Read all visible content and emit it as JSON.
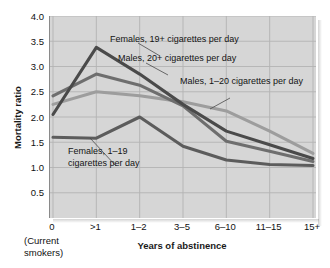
{
  "chart_data": {
    "type": "line",
    "title": "",
    "xlabel": "Years of abstinence",
    "ylabel": "Mortality ratio",
    "xaxis_note": "(Current\nsmokers)",
    "xaxis_note_line1": "(Current",
    "xaxis_note_line2": "smokers)",
    "categories": [
      "0",
      ">1",
      "1–2",
      "3–5",
      "6–10",
      "11–15",
      "15+"
    ],
    "ylim": [
      0.0,
      4.0
    ],
    "yticks": [
      "4.0",
      "3.5",
      "3.0",
      "2.5",
      "2.0",
      "1.5",
      "1.0",
      "0.5"
    ],
    "ytick_values": [
      4.0,
      3.5,
      3.0,
      2.5,
      2.0,
      1.5,
      1.0,
      0.5
    ],
    "grid": true,
    "legend_position": "inline-annotations",
    "series": [
      {
        "name": "Females, 19+ cigarettes per day",
        "color": "#4a4a4a",
        "values": [
          2.05,
          3.38,
          2.85,
          2.25,
          1.72,
          1.45,
          1.18
        ]
      },
      {
        "name": "Males, 20+ cigarettes per day",
        "color": "#6e6e6e",
        "values": [
          2.42,
          2.85,
          2.63,
          2.22,
          1.52,
          1.32,
          1.12
        ]
      },
      {
        "name": "Males, 1–20 cigarettes per day",
        "color": "#9d9d9d",
        "values": [
          2.25,
          2.5,
          2.42,
          2.3,
          2.12,
          1.72,
          1.28
        ]
      },
      {
        "name": "Females, 1–19 cigarettes per day",
        "color": "#5c5c5c",
        "values": [
          1.6,
          1.58,
          2.0,
          1.42,
          1.15,
          1.06,
          1.04
        ]
      }
    ],
    "annotations": [
      {
        "id": "anno-females-19plus",
        "text": "Females, 19+ cigarettes per day",
        "target_series": "Females, 19+ cigarettes per day"
      },
      {
        "id": "anno-males-20plus",
        "text": "Males, 20+ cigarettes per day",
        "target_series": "Males, 20+ cigarettes per day"
      },
      {
        "id": "anno-males-1-20",
        "text": "Males, 1–20 cigarettes per day",
        "target_series": "Males, 1–20 cigarettes per day"
      },
      {
        "id": "anno-females-1-19-l1",
        "text": "Females, 1–19",
        "target_series": "Females, 1–19 cigarettes per day"
      },
      {
        "id": "anno-females-1-19-l2",
        "text": "cigarettes per day",
        "target_series": "Females, 1–19 cigarettes per day"
      }
    ],
    "colors": {
      "plot_background": "#d6d6d6",
      "gridline": "#b3b3b3",
      "axis": "#8a8a8a",
      "text": "#111111"
    }
  }
}
